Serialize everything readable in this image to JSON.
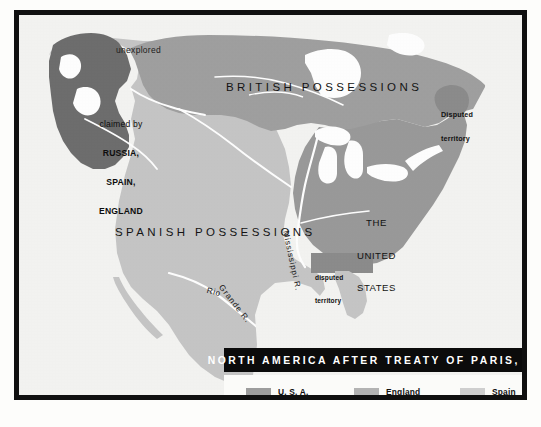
{
  "map": {
    "title": "NORTH AMERICA AFTER TREATY OF PARIS, 1783",
    "labels": {
      "unexplored": "unexplored",
      "british_possessions": "BRITISH POSSESSIONS",
      "claimed_line1": "claimed by",
      "claimed_line2": "RUSSIA,",
      "claimed_line3": "SPAIN,",
      "claimed_line4": "ENGLAND",
      "disputed_ne_line1": "Disputed",
      "disputed_ne_line2": "territory",
      "united_states_line1": "THE",
      "united_states_line2": "UNITED",
      "united_states_line3": "STATES",
      "spanish_possessions": "SPANISH POSSESSIONS",
      "disputed_se_line1": "disputed",
      "disputed_se_line2": "territory",
      "mississippi_river": "Mississippi R.",
      "rio": "Rio",
      "grande": "Grande R."
    }
  },
  "legend": {
    "entries": [
      {
        "label": "U. S. A.",
        "color": "#9d9d9d"
      },
      {
        "label": "England",
        "color": "#b3b3b3"
      },
      {
        "label": "Spain",
        "color": "#cfcfcf"
      }
    ]
  },
  "colors": {
    "paper": "#f4f4f2",
    "frame": "#101010",
    "banner_bg": "#0b0b0b",
    "banner_text": "#ffffff",
    "region_claimed_dark": "#6e6e6e",
    "region_british": "#a0a0a0",
    "region_united_states": "#9a9a9a",
    "region_spanish": "#c6c6c6",
    "disputed_patch": "#8c8c8c",
    "water_white": "#ffffff"
  }
}
